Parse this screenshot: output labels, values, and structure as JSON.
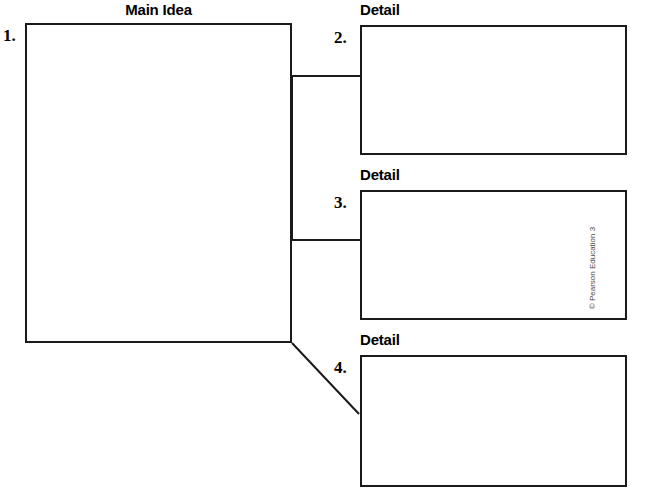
{
  "worksheet": {
    "type": "main-idea-and-details-graphic-organizer",
    "copyright": "© Pearson Education 3"
  },
  "main_idea": {
    "heading": "Main Idea",
    "number": "1.",
    "value": "",
    "placeholder": ""
  },
  "details": [
    {
      "heading": "Detail",
      "number": "2.",
      "value": "",
      "placeholder": ""
    },
    {
      "heading": "Detail",
      "number": "3.",
      "value": "",
      "placeholder": ""
    },
    {
      "heading": "Detail",
      "number": "4.",
      "value": "",
      "placeholder": ""
    }
  ],
  "colors": {
    "ink": "#1a1a1a",
    "paper": "#ffffff",
    "copyright_gray": "#4a4a4a"
  }
}
